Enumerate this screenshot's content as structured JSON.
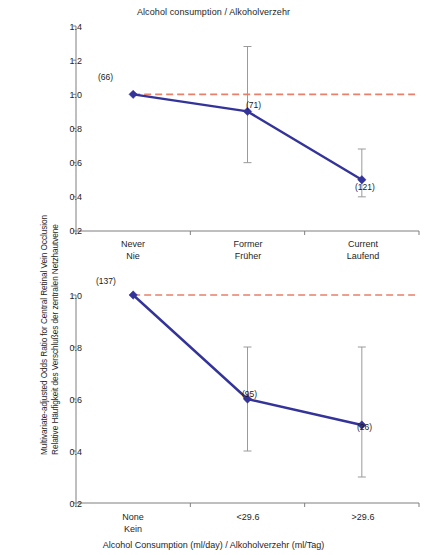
{
  "figure": {
    "top_panel_title": "Alcohol consumption / Alkoholverzehr",
    "x_axis_title": "Alcohol Consumption (ml/day) / Alkoholverzehr (ml/Tag)",
    "y_axis_label_line1": "Multivariate-adjusted Odds Ratio for Central Retinal Vein Occlusion",
    "y_axis_label_line2": "Relative Häufigkeit des Verschlußes der zentralen Netzhautvene",
    "colors": {
      "series_line": "#333399",
      "marker": "#333399",
      "error_bar": "#9a9a9a",
      "reference_line": "#E8806B",
      "axis": "#7f7f7f",
      "text": "#262626"
    }
  },
  "chart_data": [
    {
      "type": "line",
      "panel": "top",
      "title": "Alcohol consumption / Alkoholverzehr",
      "xlabel": "",
      "ylabel": "Multivariate-adjusted Odds Ratio for Central Retinal Vein Occlusion / Relative Häufigkeit des Verschlußes der zentralen Netzhautvene",
      "categories": [
        "Never\nNie",
        "Former\nFrüher",
        "Current\nLaufend"
      ],
      "category_labels_en": [
        "Never",
        "Former",
        "Current"
      ],
      "category_labels_de": [
        "Nie",
        "Früher",
        "Laufend"
      ],
      "values": [
        1.0,
        0.9,
        0.5
      ],
      "error_low": [
        1.0,
        0.6,
        0.4
      ],
      "error_high": [
        1.0,
        1.28,
        0.68
      ],
      "point_labels": [
        "(66)",
        "(71)",
        "(121)"
      ],
      "counts": [
        66,
        71,
        121
      ],
      "ylim": [
        0.2,
        1.4
      ],
      "yticks": [
        "1.4",
        "1.2",
        "1.0",
        "0.8",
        "0.6",
        "0.4",
        "0.2"
      ],
      "ytick_values": [
        1.4,
        1.2,
        1.0,
        0.8,
        0.6,
        0.4,
        0.2
      ],
      "reference_line_y": 1.0,
      "grid": false,
      "legend": "none"
    },
    {
      "type": "line",
      "panel": "bottom",
      "title": "",
      "xlabel": "Alcohol Consumption (ml/day) / Alkoholverzehr (ml/Tag)",
      "ylabel": "Multivariate-adjusted Odds Ratio for Central Retinal Vein Occlusion / Relative Häufigkeit des Verschlußes der zentralen Netzhautvene",
      "categories": [
        "None\nKein",
        "<29.6",
        ">29.6"
      ],
      "category_labels_en": [
        "None",
        "<29.6",
        ">29.6"
      ],
      "category_labels_de": [
        "Kein",
        "",
        ""
      ],
      "values": [
        1.0,
        0.6,
        0.5
      ],
      "error_low": [
        1.0,
        0.4,
        0.3
      ],
      "error_high": [
        1.0,
        0.8,
        0.8
      ],
      "point_labels": [
        "(137)",
        "(95)",
        "(26)"
      ],
      "counts": [
        137,
        95,
        26
      ],
      "ylim": [
        0.2,
        1.0
      ],
      "yticks": [
        "1.0",
        "0.8",
        "0.6",
        "0.4",
        "0.2"
      ],
      "ytick_values": [
        1.0,
        0.8,
        0.6,
        0.4,
        0.2
      ],
      "reference_line_y": 1.0,
      "grid": false,
      "legend": "none"
    }
  ]
}
